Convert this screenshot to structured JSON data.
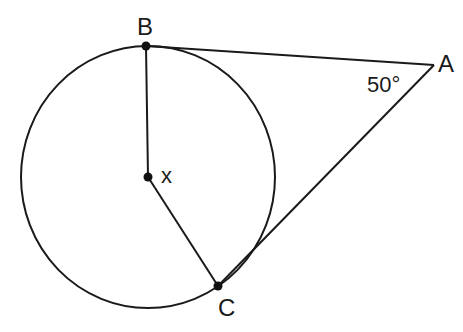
{
  "diagram": {
    "type": "geometry",
    "points": {
      "B": {
        "label": "B"
      },
      "A": {
        "label": "A"
      },
      "C": {
        "label": "C"
      },
      "X": {
        "label": "x"
      }
    },
    "angle_label": "50°",
    "colors": {
      "stroke": "#1a1a1a",
      "background": "#ffffff"
    }
  }
}
